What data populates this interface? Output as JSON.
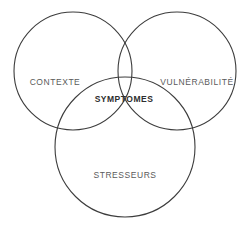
{
  "diagram": {
    "type": "venn-3-circle",
    "background_color": "#ffffff",
    "stroke_color": "#3c3c3c",
    "label_color": "#5a5a5a",
    "center_label_color": "#2e2e2e",
    "circles": [
      {
        "name": "contexte",
        "label": "CONTEXTE",
        "cx": 73,
        "cy": 71,
        "r": 59
      },
      {
        "name": "vulnerabilite",
        "label": "VULNÉRABILITÉ",
        "cx": 177,
        "cy": 71,
        "r": 59
      },
      {
        "name": "stresseurs",
        "label": "STRESSEURS",
        "cx": 125,
        "cy": 147,
        "r": 70
      }
    ],
    "labels": {
      "contexte": "CONTEXTE",
      "vulnerabilite": "VULNÉRABILITÉ",
      "stresseurs": "STRESSEURS",
      "symptomes": "SYMPTOMES"
    }
  }
}
